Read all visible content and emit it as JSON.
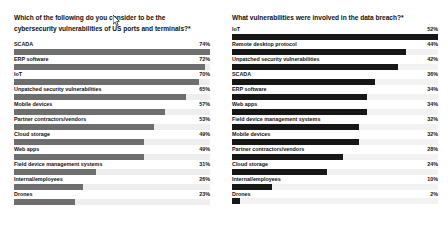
{
  "chart_data": [
    {
      "type": "bar",
      "orientation": "horizontal",
      "title": "Which of the following do you consider to be the cybersecurity vulnerabilities of US ports and terminals?*",
      "xlabel": "",
      "ylabel": "",
      "xlim": [
        0,
        74
      ],
      "grid": false,
      "legend": "none",
      "bar_color": "#6e6e6e",
      "track_color": "#eeeeee",
      "value_suffix": "%",
      "categories": [
        "SCADA",
        "ERP software",
        "IoT",
        "Unpatched security vulnerabilities",
        "Mobile devices",
        "Partner contractors/vendors",
        "Cloud storage",
        "Web apps",
        "Field device management systems",
        "Internal/employees",
        "Drones"
      ],
      "values": [
        74,
        72,
        70,
        65,
        57,
        53,
        49,
        49,
        31,
        26,
        23
      ],
      "value_labels": [
        "74%",
        "72%",
        "70%",
        "65%",
        "57%",
        "53%",
        "49%",
        "49%",
        "31%",
        "26%",
        "23%"
      ]
    },
    {
      "type": "bar",
      "orientation": "horizontal",
      "title": "What vulnerabilities were involved in the data breach?*",
      "xlabel": "",
      "ylabel": "",
      "xlim": [
        0,
        52
      ],
      "grid": false,
      "legend": "none",
      "bar_color": "#171717",
      "track_color": "#f2f2f2",
      "value_suffix": "%",
      "categories": [
        "IoT",
        "Remote desktop protocol",
        "Unpatched security vulnerabilities",
        "SCADA",
        "ERP software",
        "Web apps",
        "Field device management systems",
        "Mobile devices",
        "Partner contractors/vendors",
        "Cloud storage",
        "Internal/employees",
        "Drones"
      ],
      "values": [
        52,
        44,
        42,
        36,
        34,
        34,
        32,
        32,
        28,
        24,
        10,
        2
      ],
      "value_labels": [
        "52%",
        "44%",
        "42%",
        "36%",
        "34%",
        "34%",
        "32%",
        "32%",
        "28%",
        "24%",
        "10%",
        "2%"
      ]
    }
  ],
  "left_panel": {
    "title": "Which of the following do you consider to be the\ncybersecurity vulnerabilities of US ports and terminals?*"
  },
  "right_panel": {
    "title": "What vulnerabilities were involved in the data breach?*"
  },
  "cursor": {
    "icon": "mouse-pointer-icon"
  }
}
